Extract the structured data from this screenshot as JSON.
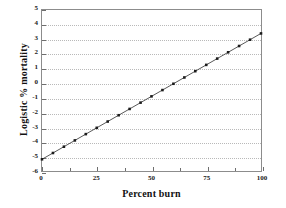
{
  "chart_data": {
    "type": "line",
    "title": "",
    "xlabel": "Percent burn",
    "ylabel": "Logistic % mortality",
    "xlim": [
      0,
      100
    ],
    "ylim": [
      -6,
      5
    ],
    "grid": "horizontal-dotted",
    "legend": "none",
    "x_ticks": [
      0,
      25,
      50,
      75,
      100
    ],
    "x_tick_labels": [
      "0",
      "25",
      "50",
      "75",
      "100"
    ],
    "x_minor_ticks": [
      12.5,
      37.5,
      62.5,
      87.5
    ],
    "y_ticks": [
      5,
      4,
      3,
      2,
      1,
      0,
      -1,
      -2,
      -3,
      -4,
      -5,
      -6
    ],
    "y_tick_labels": [
      "5",
      "4",
      "3",
      "2",
      "1",
      "0",
      "-1",
      "-2",
      "-3",
      "-4",
      "-5",
      "-6"
    ],
    "series": [
      {
        "name": "Logistic fit",
        "marker": "square",
        "line_style": "solid",
        "color": "#2b2b2b",
        "x": [
          0,
          5,
          10,
          15,
          20,
          25,
          30,
          35,
          40,
          45,
          50,
          55,
          60,
          65,
          70,
          75,
          80,
          85,
          90,
          95,
          100
        ],
        "y": [
          -5.2,
          -4.77,
          -4.34,
          -3.91,
          -3.48,
          -3.05,
          -2.62,
          -2.19,
          -1.76,
          -1.33,
          -0.9,
          -0.47,
          -0.04,
          0.39,
          0.82,
          1.25,
          1.68,
          2.11,
          2.54,
          2.97,
          3.4
        ]
      }
    ]
  },
  "axes": {
    "x_title": "Percent burn",
    "y_title": "Logistic % mortality"
  }
}
